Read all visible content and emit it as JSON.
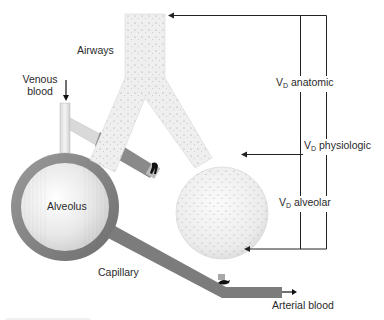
{
  "diagram": {
    "labels": {
      "airways": "Airways",
      "venous_blood_line1": "Venous",
      "venous_blood_line2": "blood",
      "alveolus": "Alveolus",
      "capillary": "Capillary",
      "arterial_blood": "Arterial blood",
      "vd_symbol": "V",
      "vd_subscript": "D",
      "vd_anatomic": "anatomic",
      "vd_physiologic": "physiologic",
      "vd_alveolar": "alveolar"
    },
    "components": [
      "trachea",
      "left-bronchus",
      "right-bronchus",
      "perfused-alveolus",
      "unperfused-alveolus",
      "capillary-ring",
      "venous-inflow",
      "arterial-outflow",
      "clamped-capillary-branch",
      "capillary-clamp"
    ],
    "brackets": [
      {
        "name": "VD anatomic",
        "target": "airways"
      },
      {
        "name": "VD physiologic",
        "target": "airways + unperfused alveolus"
      },
      {
        "name": "VD alveolar",
        "target": "unperfused alveolus"
      }
    ],
    "colors": {
      "capillary": "#7a7a7a",
      "airway_fill": "#ededed",
      "alveolus_fill": "#e6e6e6",
      "line": "#222222",
      "text": "#2a2a2a"
    }
  }
}
